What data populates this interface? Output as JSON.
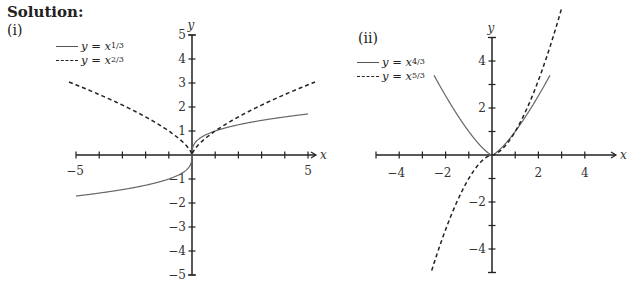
{
  "heading": "Solution:",
  "chart_data": [
    {
      "type": "line",
      "part_label": "(i)",
      "title": "",
      "xlabel": "x",
      "ylabel": "y",
      "xlim": [
        -5,
        5
      ],
      "ylim": [
        -5,
        5
      ],
      "x_tick_labels": [
        "-5",
        "5"
      ],
      "y_tick_labels": [
        "5",
        "4",
        "3",
        "2",
        "1",
        "-1",
        "-2",
        "-3",
        "-4",
        "-5"
      ],
      "grid": false,
      "legend_position": "upper-left",
      "series": [
        {
          "name": "y = x^(1/3)",
          "style": "solid",
          "legend_text": "y = x",
          "legend_sup": "1/3",
          "x": [
            -5,
            -4,
            -3,
            -2,
            -1,
            -0.5,
            -0.1,
            0,
            0.1,
            0.5,
            1,
            2,
            3,
            4,
            5
          ],
          "values": [
            -1.71,
            -1.59,
            -1.44,
            -1.26,
            -1.0,
            -0.79,
            -0.46,
            0,
            0.46,
            0.79,
            1.0,
            1.26,
            1.44,
            1.59,
            1.71
          ]
        },
        {
          "name": "y = x^(2/3)",
          "style": "dashed",
          "legend_text": "y = x",
          "legend_sup": "2/3",
          "x": [
            -5.3,
            -4,
            -3,
            -2,
            -1,
            -0.5,
            0,
            0.5,
            1,
            2,
            3,
            4,
            5.3
          ],
          "values": [
            3.04,
            2.52,
            2.08,
            1.59,
            1.0,
            0.63,
            0,
            0.63,
            1.0,
            1.59,
            2.08,
            2.52,
            3.04
          ]
        }
      ]
    },
    {
      "type": "line",
      "part_label": "(ii)",
      "title": "",
      "xlabel": "x",
      "ylabel": "y",
      "xlim": [
        -5,
        5
      ],
      "ylim": [
        -5,
        5
      ],
      "x_tick_labels": [
        "-4",
        "-2",
        "2",
        "4"
      ],
      "y_tick_labels": [
        "4",
        "2",
        "-2",
        "-4"
      ],
      "grid": false,
      "legend_position": "upper-left",
      "series": [
        {
          "name": "y = x^(4/3)",
          "style": "solid",
          "legend_text": "y = x",
          "legend_sup": "4/3",
          "x": [
            -2.5,
            -2,
            -1.5,
            -1,
            -0.5,
            0,
            0.5,
            1,
            1.5,
            2,
            2.5
          ],
          "values": [
            3.39,
            2.52,
            1.72,
            1.0,
            0.4,
            0,
            0.4,
            1.0,
            1.72,
            2.52,
            3.39
          ]
        },
        {
          "name": "y = x^(5/3)",
          "style": "dashed",
          "legend_text": "y = x",
          "legend_sup": "5/3",
          "x": [
            -2.6,
            -2,
            -1.5,
            -1,
            -0.5,
            0,
            0.5,
            1,
            1.5,
            2,
            2.5,
            3.1
          ],
          "values": [
            -4.92,
            -3.17,
            -1.97,
            -1.0,
            -0.31,
            0,
            0.31,
            1.0,
            1.97,
            3.17,
            4.61,
            6.59
          ]
        }
      ]
    }
  ]
}
